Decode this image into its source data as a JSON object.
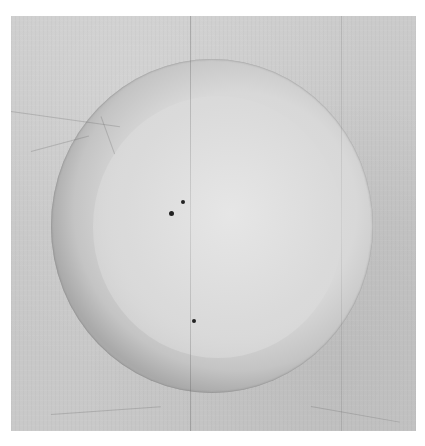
{
  "image": {
    "description": "Aged grayscale paper/silk scroll with a large painted circle (moon or ensō)",
    "background_color": "#ffffff",
    "paper": {
      "x": 11,
      "y": 16,
      "width": 405,
      "height": 415,
      "color": "#c8c8c8"
    },
    "circle": {
      "cx": 212,
      "cy": 226,
      "rx": 161,
      "ry": 167,
      "ring_color": "#aeaeae",
      "inner_color": "#dcdcdc"
    },
    "crease": {
      "x": 190
    },
    "dots": [
      {
        "x": 183,
        "y": 202,
        "r": 2
      },
      {
        "x": 171,
        "y": 213,
        "r": 2.5
      },
      {
        "x": 194,
        "y": 321,
        "r": 1.8
      }
    ]
  }
}
